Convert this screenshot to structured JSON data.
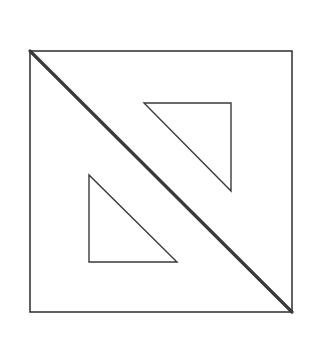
{
  "figure": {
    "background": "#ffffff",
    "stroke_color": "#3a3a3a",
    "outer_square": {
      "x1": 30,
      "y1": 51,
      "x2": 292,
      "y2": 312,
      "stroke_width": 1.6
    },
    "diagonal": {
      "x1": 30,
      "y1": 51,
      "x2": 292,
      "y2": 312,
      "stroke_width": 3.2
    },
    "upper_cutout": {
      "points": [
        [
          144,
          103
        ],
        [
          231,
          103
        ],
        [
          231,
          191
        ]
      ],
      "stroke_width": 1.4
    },
    "lower_cutout": {
      "points": [
        [
          89,
          175
        ],
        [
          89,
          262
        ],
        [
          177,
          262
        ]
      ],
      "stroke_width": 1.4
    }
  }
}
